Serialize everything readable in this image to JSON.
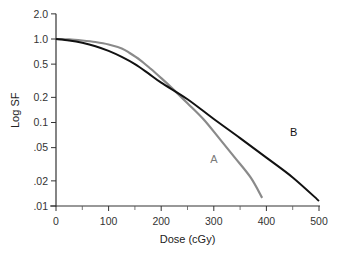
{
  "chart_data": {
    "type": "line",
    "title": "",
    "xlabel": "Dose (cGy)",
    "ylabel": "Log SF",
    "xlim": [
      0,
      500
    ],
    "ylim": [
      0.01,
      2.0
    ],
    "yscale": "log",
    "grid": false,
    "x_ticks": [
      0,
      100,
      200,
      300,
      400,
      500
    ],
    "x_minor_ticks": [
      50,
      150,
      250,
      350,
      450
    ],
    "y_ticks": [
      {
        "value": 2.0,
        "label": "2.0"
      },
      {
        "value": 1.0,
        "label": "1.0"
      },
      {
        "value": 0.5,
        "label": "0.5"
      },
      {
        "value": 0.2,
        "label": "0.2"
      },
      {
        "value": 0.1,
        "label": "0.1"
      },
      {
        "value": 0.05,
        "label": ".05"
      },
      {
        "value": 0.02,
        "label": ".02"
      },
      {
        "value": 0.01,
        "label": ".01"
      }
    ],
    "series": [
      {
        "name": "A",
        "color": "#8a8a8a",
        "label_position": {
          "x": 300,
          "y": 0.033
        },
        "x": [
          0,
          25,
          50,
          75,
          100,
          125,
          140,
          160,
          180,
          200,
          220,
          250,
          280,
          310,
          340,
          370,
          392
        ],
        "y": [
          1.0,
          0.99,
          0.96,
          0.92,
          0.86,
          0.77,
          0.68,
          0.56,
          0.44,
          0.34,
          0.26,
          0.17,
          0.11,
          0.065,
          0.038,
          0.022,
          0.0125
        ]
      },
      {
        "name": "B",
        "color": "#111111",
        "label_position": {
          "x": 452,
          "y": 0.068
        },
        "x": [
          0,
          25,
          50,
          75,
          100,
          125,
          150,
          175,
          200,
          250,
          300,
          350,
          400,
          450,
          500
        ],
        "y": [
          1.0,
          0.96,
          0.9,
          0.82,
          0.72,
          0.61,
          0.5,
          0.39,
          0.3,
          0.19,
          0.11,
          0.065,
          0.038,
          0.022,
          0.0115
        ]
      }
    ]
  }
}
